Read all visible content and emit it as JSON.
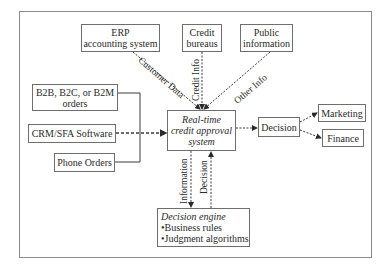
{
  "diagram": {
    "nodes": {
      "erp": {
        "line1": "ERP",
        "line2": "accounting system"
      },
      "credit_bureaus": {
        "line1": "Credit",
        "line2": "bureaus"
      },
      "public_info": {
        "line1": "Public",
        "line2": "information"
      },
      "b2b": {
        "line1": "B2B, B2C, or B2M",
        "line2": "orders"
      },
      "crm": {
        "line1": "CRM/SFA Software"
      },
      "phone": {
        "line1": "Phone Orders"
      },
      "core": {
        "line1": "Real-time",
        "line2": "credit approval",
        "line3": "system"
      },
      "decision": {
        "line1": "Decision"
      },
      "marketing": {
        "line1": "Marketing"
      },
      "finance": {
        "line1": "Finance"
      },
      "engine": {
        "line1": "Decision engine",
        "line2": "•Business rules",
        "line3": "•Judgment algorithms"
      }
    },
    "edge_labels": {
      "customer_data": "Customer Data",
      "credit_info": "Credit Info",
      "other_info": "Other Info",
      "information": "Information",
      "decision": "Decision"
    },
    "colors": {
      "line": "#3a3a3a",
      "border": "#6e6e6e",
      "frame": "#8a8a8a"
    }
  }
}
